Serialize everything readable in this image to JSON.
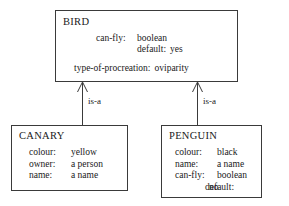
{
  "diagram": {
    "type": "frame-hierarchy",
    "frames": [
      {
        "id": "bird",
        "title": "BIRD",
        "slots": [
          {
            "name": "can-fly:",
            "value": "boolean"
          },
          {
            "name": "default:",
            "value": "yes"
          },
          {
            "name": "type-of-procreation:",
            "value": "oviparity"
          }
        ]
      },
      {
        "id": "canary",
        "title": "CANARY",
        "slots": [
          {
            "name": "colour:",
            "value": "yellow"
          },
          {
            "name": "owner:",
            "value": "a person"
          },
          {
            "name": "name:",
            "value": "a name"
          }
        ]
      },
      {
        "id": "penguin",
        "title": "PENGUIN",
        "slots": [
          {
            "name": "colour:",
            "value": "black"
          },
          {
            "name": "name:",
            "value": "a name"
          },
          {
            "name": "can-fly:",
            "value": "boolean"
          },
          {
            "name": "default:",
            "value": "no"
          }
        ]
      }
    ],
    "links": [
      {
        "id": "canary-to-bird",
        "label": "is-a",
        "from": "CANARY",
        "to": "BIRD"
      },
      {
        "id": "penguin-to-bird",
        "label": "is-a",
        "from": "PENGUIN",
        "to": "BIRD"
      }
    ],
    "colors": {
      "stroke": "#3a3a3a",
      "text": "#1a1a1a",
      "background": "#ffffff"
    }
  }
}
